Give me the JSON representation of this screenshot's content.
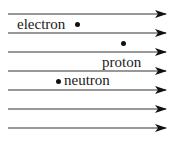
{
  "diagram": {
    "field_lines": {
      "count": 7,
      "direction": "right",
      "color": "#333333",
      "y_positions": [
        14,
        33,
        52,
        71,
        90,
        109,
        128
      ]
    },
    "particles": [
      {
        "name": "electron",
        "label": "electron"
      },
      {
        "name": "proton",
        "label": "proton"
      },
      {
        "name": "neutron",
        "label": "neutron"
      }
    ]
  }
}
